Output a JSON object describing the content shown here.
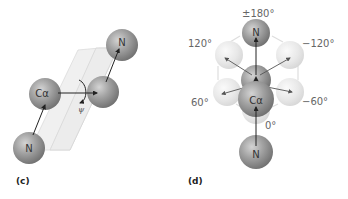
{
  "panels": [
    {
      "id": "c",
      "label": "(c)",
      "atoms": [
        {
          "name": "N",
          "label": "N",
          "role": "nitrogen-bottom"
        },
        {
          "name": "Calpha",
          "label": "Cα",
          "role": "alpha-carbon"
        },
        {
          "name": "C",
          "label": "",
          "role": "carbonyl-carbon"
        },
        {
          "name": "N",
          "label": "N",
          "role": "nitrogen-top"
        }
      ],
      "torsion_symbol": "ψ"
    },
    {
      "id": "d",
      "label": "(d)",
      "atoms": [
        {
          "name": "N",
          "label": "N",
          "role": "nitrogen-top"
        },
        {
          "name": "Calpha",
          "label": "Cα",
          "role": "alpha-carbon"
        },
        {
          "name": "N",
          "label": "N",
          "role": "nitrogen-bottom"
        }
      ],
      "angles": {
        "top": "±180°",
        "upper_left": "120°",
        "upper_right": "−120°",
        "lower_left": "60°",
        "lower_right": "−60°",
        "bottom": "0°"
      }
    }
  ],
  "colors": {
    "atom_dark": "#8a8a8a",
    "atom_light": "#e4e4e4",
    "plane": "#ececec",
    "arrow": "#222222"
  }
}
